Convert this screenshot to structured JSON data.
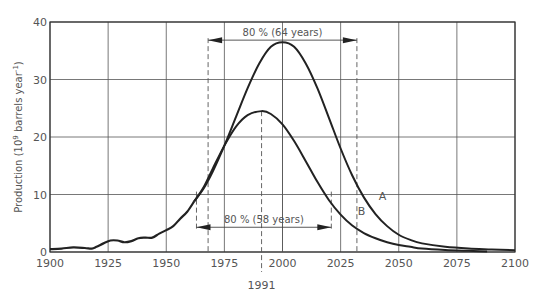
{
  "chart_data": {
    "type": "line",
    "title": "",
    "xlabel": "",
    "ylabel": "Production (10^9 barrels year^-1)",
    "ylabel_parts": {
      "main": "Production (10",
      "sup1": "9",
      "mid": " barrels year",
      "sup2": "-1",
      "end": ")"
    },
    "xlim": [
      1900,
      2100
    ],
    "ylim": [
      0,
      40
    ],
    "grid": true,
    "x_ticks": [
      1900,
      1925,
      1950,
      1975,
      2000,
      2025,
      2050,
      2075,
      2100
    ],
    "y_ticks": [
      0,
      10,
      20,
      30,
      40
    ],
    "x_tick_labels": [
      "1900",
      "1925",
      "1950",
      "1975",
      "2000",
      "2025",
      "2050",
      "2075",
      "2100"
    ],
    "y_tick_labels": [
      "0",
      "10",
      "20",
      "30",
      "40"
    ],
    "historical": {
      "name": "Historical production",
      "x": [
        1900,
        1905,
        1910,
        1915,
        1918,
        1920,
        1923,
        1926,
        1929,
        1932,
        1935,
        1938,
        1941,
        1944,
        1947,
        1950,
        1953,
        1956,
        1959,
        1962
      ],
      "y": [
        0.5,
        0.6,
        0.8,
        0.7,
        0.6,
        0.9,
        1.5,
        2.0,
        2.0,
        1.7,
        1.9,
        2.4,
        2.5,
        2.5,
        3.2,
        3.8,
        4.5,
        5.8,
        7.0,
        8.8
      ]
    },
    "series": [
      {
        "name": "A",
        "peak_year": 2000,
        "peak_value": 36.5,
        "x": [
          1962,
          1966,
          1970,
          1975,
          1980,
          1985,
          1990,
          1995,
          2000,
          2005,
          2010,
          2015,
          2020,
          2025,
          2030,
          2035,
          2040,
          2045,
          2050,
          2055,
          2060,
          2070,
          2080,
          2090,
          2100
        ],
        "y": [
          8.8,
          11.0,
          14.0,
          18.5,
          23.5,
          28.5,
          32.8,
          35.7,
          36.5,
          35.7,
          32.8,
          28.5,
          23.3,
          18.0,
          13.3,
          9.5,
          6.6,
          4.5,
          3.0,
          2.1,
          1.5,
          0.9,
          0.6,
          0.45,
          0.3
        ]
      },
      {
        "name": "B",
        "peak_year": 1991,
        "peak_value": 24.5,
        "x": [
          1962,
          1966,
          1970,
          1975,
          1980,
          1985,
          1991,
          1995,
          2000,
          2005,
          2010,
          2015,
          2020,
          2025,
          2030,
          2035,
          2040,
          2045,
          2050,
          2055,
          2060,
          2070,
          2080,
          2088
        ],
        "y": [
          8.8,
          11.2,
          14.5,
          18.5,
          21.8,
          23.8,
          24.5,
          24.0,
          22.2,
          19.3,
          15.8,
          12.2,
          9.0,
          6.5,
          4.6,
          3.3,
          2.4,
          1.7,
          1.2,
          0.9,
          0.6,
          0.35,
          0.2,
          0.1
        ]
      }
    ],
    "annotations": [
      {
        "text": "80 % (64 years)",
        "series": "A",
        "from": 1968,
        "to": 2032,
        "y": 36.5
      },
      {
        "text": "80 % (58 years)",
        "series": "B",
        "from": 1963,
        "to": 2021,
        "y": 5
      },
      {
        "text": "1991",
        "type": "peak-year-marker",
        "x": 1991
      },
      {
        "text": "A",
        "type": "series-label",
        "x": 2043,
        "y": 9
      },
      {
        "text": "B",
        "type": "series-label",
        "x": 2034,
        "y": 6.5
      }
    ],
    "legend": "none (inline labels A and B)"
  }
}
